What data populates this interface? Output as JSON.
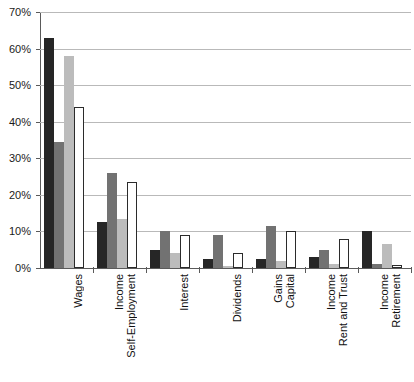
{
  "chart_data": {
    "type": "bar",
    "title": "",
    "xlabel": "",
    "ylabel": "",
    "ylim": [
      0,
      70
    ],
    "ytick_values": [
      0,
      10,
      20,
      30,
      40,
      50,
      60,
      70
    ],
    "ytick_labels": [
      "0%",
      "10%",
      "20%",
      "30%",
      "40%",
      "50%",
      "60%",
      "70%"
    ],
    "grid": true,
    "legend": "none",
    "categories": [
      "Wages",
      "Self-Employment Income",
      "Interest",
      "Dividends",
      "Capital Gains",
      "Rent and Trust Income",
      "Retirement Income"
    ],
    "category_lines": [
      [
        "Wages"
      ],
      [
        "Self-Employment",
        "Income"
      ],
      [
        "Interest"
      ],
      [
        "Dividends"
      ],
      [
        "Capital",
        "Gains"
      ],
      [
        "Rent and Trust",
        "Income"
      ],
      [
        "Retirement",
        "Income"
      ]
    ],
    "series": [
      {
        "name": "Series 1",
        "color": "#262626",
        "style": "solid-black",
        "values": [
          63.0,
          12.5,
          5.0,
          2.5,
          2.5,
          3.0,
          10.0
        ]
      },
      {
        "name": "Series 2",
        "color": "#727272",
        "style": "solid-dark-gray",
        "values": [
          34.5,
          26.0,
          10.0,
          9.0,
          11.5,
          5.0,
          1.0
        ]
      },
      {
        "name": "Series 3",
        "color": "#bcbcbc",
        "style": "solid-light-gray",
        "values": [
          58.0,
          13.5,
          4.0,
          0.5,
          2.0,
          1.0,
          6.5
        ]
      },
      {
        "name": "Series 4",
        "color": "#ffffff",
        "style": "outlined-white",
        "values": [
          44.0,
          23.5,
          9.0,
          4.0,
          10.0,
          8.0,
          0.8
        ]
      }
    ]
  },
  "axis": {
    "gridline_color": "#b9b9b9",
    "axis_color": "#5a5a5a"
  }
}
